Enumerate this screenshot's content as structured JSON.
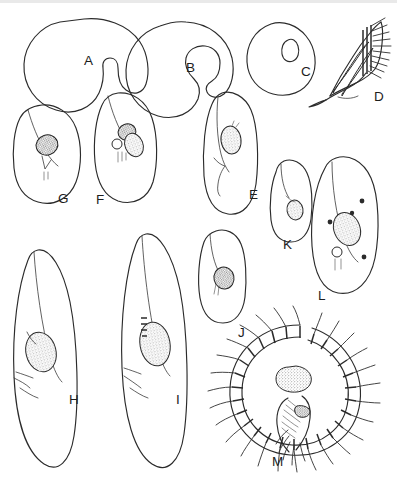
{
  "plate": {
    "title": "Ciliate protozoa morphology plate",
    "background_color": "#ffffff",
    "ink_color": "#2b2b2b",
    "width": 397,
    "height": 483,
    "panel_count": 13
  },
  "figures": [
    {
      "id": "A",
      "label": "A",
      "label_x": 84,
      "label_y": 65,
      "view": "outline",
      "description": "Rounded cell outline with deep notch / oral indentation at lower right"
    },
    {
      "id": "B",
      "label": "B",
      "label_x": 186,
      "label_y": 72,
      "view": "outline",
      "description": "Rounded cell outline with narrow hook-shaped invagination at right"
    },
    {
      "id": "C",
      "label": "C",
      "label_x": 301,
      "label_y": 76,
      "view": "outline",
      "description": "Oval cell outline enclosing a small teardrop-shaped vacuole"
    },
    {
      "id": "D",
      "label": "D",
      "label_x": 374,
      "label_y": 101,
      "view": "lateral oral apparatus",
      "description": "Pointed lateral view of oral region with stippled membranelle bands and fringe of long cilia"
    },
    {
      "id": "E",
      "label": "E",
      "label_x": 249,
      "label_y": 199,
      "view": "ventral",
      "description": "Elongate ovoid cell with stippled macronucleus and curved oral groove"
    },
    {
      "id": "F",
      "label": "F",
      "label_x": 96,
      "label_y": 204,
      "view": "ventral",
      "description": "Broad ovoid cell with stippled macronucleus, adjacent vesicle and contractile vacuole"
    },
    {
      "id": "G",
      "label": "G",
      "label_x": 58,
      "label_y": 203,
      "view": "ventral",
      "description": "Small ovoid cell with dark stippled macronucleus and short forked oral structure"
    },
    {
      "id": "H",
      "label": "H",
      "label_x": 69,
      "label_y": 404,
      "view": "ventral",
      "description": "Slender elongate cell with stippled macronucleus and long adoral groove"
    },
    {
      "id": "I",
      "label": "I",
      "label_x": 176,
      "label_y": 404,
      "view": "ventral",
      "description": "Slender elongate cell with large stippled macronucleus and banded membranelles"
    },
    {
      "id": "J",
      "label": "J",
      "label_x": 238,
      "label_y": 337,
      "view": "ventral",
      "description": "Small ovoid cell with stippled macronucleus near the oral region"
    },
    {
      "id": "K",
      "label": "K",
      "label_x": 283,
      "label_y": 249,
      "view": "ventral",
      "description": "Small ovoid cell with stippled macronucleus and short oral groove"
    },
    {
      "id": "L",
      "label": "L",
      "label_x": 318,
      "label_y": 300,
      "view": "ventral",
      "description": "Large ovoid cell with stippled macronucleus and four small scattered micronuclei"
    },
    {
      "id": "M",
      "label": "M",
      "label_x": 272,
      "label_y": 466,
      "view": "ventral, ciliature",
      "description": "Circular adoral zone of membranelles forming a spiral ring of cilia around the cytostome, with stippled macronucleus"
    }
  ]
}
